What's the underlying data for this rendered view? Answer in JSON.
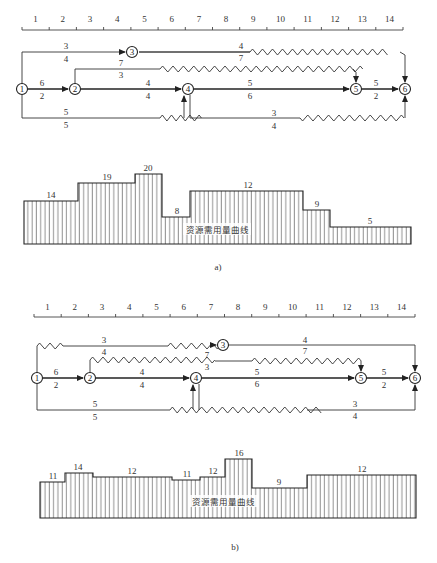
{
  "figure_a": {
    "caption": "a)",
    "timescale": [
      "1",
      "2",
      "3",
      "4",
      "5",
      "6",
      "7",
      "8",
      "9",
      "10",
      "11",
      "12",
      "13",
      "14"
    ],
    "nodes": [
      "1",
      "2",
      "3",
      "4",
      "5",
      "6"
    ],
    "activities": [
      {
        "from": "1",
        "to": "2",
        "top": "6",
        "bottom": "2"
      },
      {
        "from": "1",
        "to": "3",
        "top": "3",
        "bottom": "4"
      },
      {
        "from": "1",
        "to": "4",
        "top": "5",
        "bottom": "5"
      },
      {
        "from": "2",
        "to": "4",
        "top": "4",
        "bottom": "4"
      },
      {
        "from": "2",
        "to": "5",
        "top": "7",
        "bottom": "3"
      },
      {
        "from": "3",
        "to": "6",
        "top": "4",
        "bottom": "7"
      },
      {
        "from": "4",
        "to": "5",
        "top": "5",
        "bottom": "6"
      },
      {
        "from": "4",
        "to": "6",
        "top": "3",
        "bottom": "4"
      },
      {
        "from": "5",
        "to": "6",
        "top": "5",
        "bottom": "2"
      }
    ],
    "histogram": {
      "label": "资源需用量曲线",
      "values": [
        "14",
        "19",
        "20",
        "8",
        "12",
        "9",
        "5"
      ]
    }
  },
  "figure_b": {
    "caption": "b)",
    "timescale": [
      "1",
      "2",
      "3",
      "4",
      "5",
      "6",
      "7",
      "8",
      "9",
      "10",
      "11",
      "12",
      "13",
      "14"
    ],
    "nodes": [
      "1",
      "2",
      "3",
      "4",
      "5",
      "6"
    ],
    "activities": [
      {
        "from": "1",
        "to": "2",
        "top": "6",
        "bottom": "2"
      },
      {
        "from": "1",
        "to": "3",
        "top": "3",
        "bottom": "4"
      },
      {
        "from": "1",
        "to": "4",
        "top": "5",
        "bottom": "5"
      },
      {
        "from": "2",
        "to": "4",
        "top": "4",
        "bottom": "4"
      },
      {
        "from": "2",
        "to": "5",
        "top": "7",
        "bottom": "3"
      },
      {
        "from": "3",
        "to": "6",
        "top": "4",
        "bottom": "7"
      },
      {
        "from": "4",
        "to": "5",
        "top": "5",
        "bottom": "6"
      },
      {
        "from": "4",
        "to": "6",
        "top": "3",
        "bottom": "4"
      },
      {
        "from": "5",
        "to": "6",
        "top": "5",
        "bottom": "2"
      }
    ],
    "histogram": {
      "label": "资源需用量曲线",
      "values": [
        "11",
        "14",
        "12",
        "11",
        "12",
        "16",
        "9",
        "12"
      ]
    }
  }
}
